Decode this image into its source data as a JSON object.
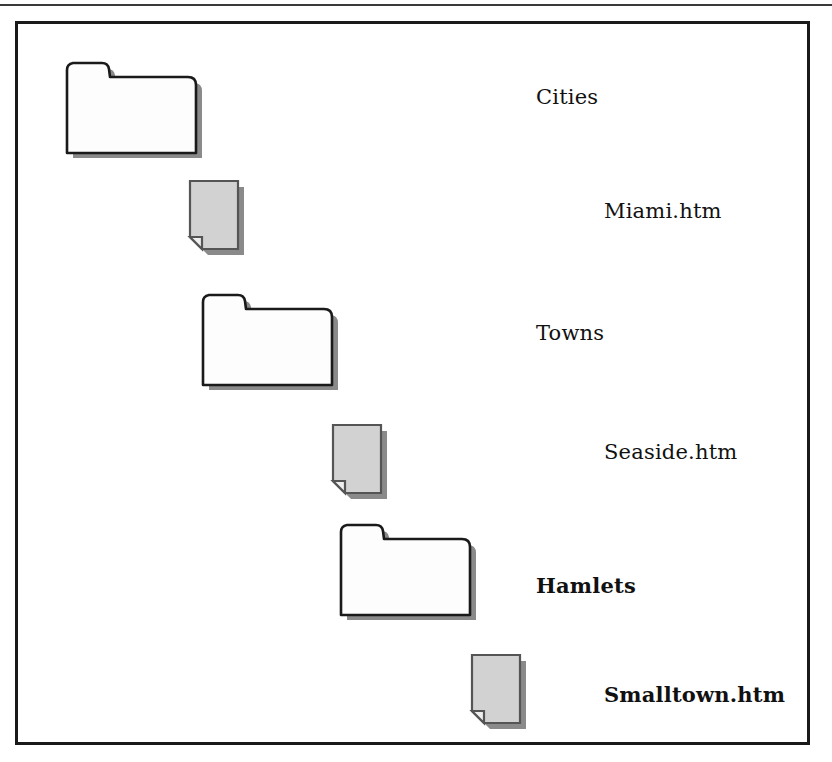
{
  "figure": {
    "type": "folder-hierarchy-diagram",
    "frame": {
      "border_color": "#1a1a1a",
      "background": "#ffffff"
    },
    "top_rule_color": "#3a3a3a",
    "colors": {
      "folder_fill": "#fdfdfd",
      "folder_outline": "#1a1a1a",
      "document_fill": "#d2d2d2",
      "document_outline": "#555555",
      "shadow": "#8a8a8a",
      "text": "#111111"
    },
    "items": [
      {
        "label": "Cities",
        "icon": "folder-icon",
        "kind": "folder",
        "bold": false,
        "level": 0,
        "icon_left": 37,
        "icon_top": 34,
        "label_left": 518,
        "label_top": 63
      },
      {
        "label": "Miami.htm",
        "icon": "document-icon",
        "kind": "document",
        "bold": false,
        "level": 1,
        "icon_left": 168,
        "icon_top": 155,
        "label_left": 586,
        "label_top": 177
      },
      {
        "label": "Towns",
        "icon": "folder-icon",
        "kind": "folder",
        "bold": false,
        "level": 1,
        "icon_left": 173,
        "icon_top": 266,
        "label_left": 518,
        "label_top": 299
      },
      {
        "label": "Seaside.htm",
        "icon": "document-icon",
        "kind": "document",
        "bold": false,
        "level": 2,
        "icon_left": 311,
        "icon_top": 399,
        "label_left": 586,
        "label_top": 418
      },
      {
        "label": "Hamlets",
        "icon": "folder-icon",
        "kind": "folder",
        "bold": true,
        "level": 2,
        "icon_left": 311,
        "icon_top": 496,
        "label_left": 518,
        "label_top": 551
      },
      {
        "label": "Smalltown.htm",
        "icon": "document-icon",
        "kind": "document",
        "bold": true,
        "level": 3,
        "icon_left": 450,
        "icon_top": 629,
        "label_left": 586,
        "label_top": 660
      }
    ]
  }
}
